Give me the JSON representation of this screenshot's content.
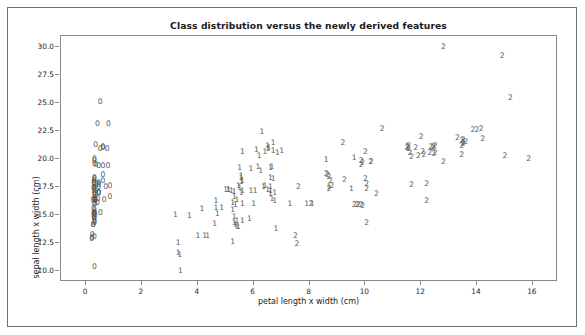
{
  "figure": {
    "title": "Class distribution versus the newly derived features",
    "background_color": "#ffffff",
    "frame_color": "#6f6f6f",
    "marker_color": "#595959"
  },
  "axes": {
    "xlabel": "petal length x width (cm)",
    "ylabel": "sepal length x width (cm)",
    "xticks": [
      "0",
      "2",
      "4",
      "6",
      "8",
      "10",
      "12",
      "14",
      "16"
    ],
    "yticks": [
      "10.0",
      "12.5",
      "15.0",
      "17.5",
      "20.0",
      "22.5",
      "25.0",
      "27.5",
      "30.0"
    ]
  },
  "chart_data": {
    "type": "scatter",
    "title": "Class distribution versus the newly derived features",
    "xlabel": "petal length x width (cm)",
    "ylabel": "sepal length x width (cm)",
    "xlim": [
      -0.9,
      16.9
    ],
    "ylim": [
      9.0,
      31.0
    ],
    "xticks": [
      0,
      2,
      4,
      6,
      8,
      10,
      12,
      14,
      16
    ],
    "yticks": [
      10.0,
      12.5,
      15.0,
      17.5,
      20.0,
      22.5,
      25.0,
      27.5,
      30.0
    ],
    "grid": false,
    "legend": "none",
    "marker_style": "class-label-text",
    "series": [
      {
        "name": "0",
        "label": "0",
        "points": [
          [
            0.28,
            17.85
          ],
          [
            0.28,
            14.7
          ],
          [
            0.26,
            15.04
          ],
          [
            0.3,
            14.56
          ],
          [
            0.28,
            18.0
          ],
          [
            0.6,
            21.06
          ],
          [
            0.24,
            16.34
          ],
          [
            0.3,
            17.0
          ],
          [
            0.2,
            12.88
          ],
          [
            0.3,
            15.19
          ],
          [
            0.45,
            19.38
          ],
          [
            0.32,
            16.32
          ],
          [
            0.24,
            14.08
          ],
          [
            0.22,
            12.9
          ],
          [
            0.4,
            23.1
          ],
          [
            0.8,
            23.1
          ],
          [
            0.6,
            21.0
          ],
          [
            0.28,
            17.85
          ],
          [
            0.75,
            20.9
          ],
          [
            0.6,
            19.38
          ],
          [
            0.45,
            17.0
          ],
          [
            0.45,
            17.64
          ],
          [
            0.3,
            16.32
          ],
          [
            0.65,
            16.32
          ],
          [
            0.51,
            15.2
          ],
          [
            0.32,
            16.5
          ],
          [
            0.45,
            17.0
          ],
          [
            0.3,
            18.2
          ],
          [
            0.3,
            17.4
          ],
          [
            0.32,
            16.2
          ],
          [
            0.32,
            15.96
          ],
          [
            0.45,
            17.0
          ],
          [
            0.3,
            20.0
          ],
          [
            0.34,
            21.28
          ],
          [
            0.3,
            15.19
          ],
          [
            0.26,
            15.5
          ],
          [
            0.42,
            16.4
          ],
          [
            0.3,
            15.19
          ],
          [
            0.22,
            13.2
          ],
          [
            0.3,
            17.4
          ],
          [
            0.26,
            17.4
          ],
          [
            0.3,
            10.35
          ],
          [
            0.26,
            14.1
          ],
          [
            0.85,
            17.6
          ],
          [
            0.78,
            19.38
          ],
          [
            0.3,
            14.7
          ],
          [
            0.6,
            18.0
          ],
          [
            0.28,
            14.8
          ],
          [
            0.5,
            25.08
          ],
          [
            0.3,
            16.5
          ],
          [
            0.3,
            16.82
          ],
          [
            0.28,
            16.0
          ],
          [
            0.45,
            17.85
          ],
          [
            0.3,
            17.1
          ],
          [
            0.3,
            15.4
          ],
          [
            0.6,
            18.6
          ],
          [
            0.3,
            19.55
          ],
          [
            0.3,
            19.8
          ],
          [
            0.4,
            16.1
          ],
          [
            0.3,
            14.3
          ],
          [
            0.3,
            13.0
          ],
          [
            0.3,
            17.2
          ],
          [
            0.5,
            20.9
          ],
          [
            0.35,
            19.5
          ],
          [
            0.3,
            17.0
          ],
          [
            0.32,
            14.95
          ],
          [
            0.38,
            17.76
          ],
          [
            0.3,
            16.3
          ],
          [
            0.7,
            17.5
          ],
          [
            0.85,
            16.6
          ],
          [
            0.3,
            17.8
          ],
          [
            0.28,
            15.0
          ],
          [
            0.3,
            14.4
          ],
          [
            0.3,
            18.3
          ],
          [
            0.45,
            17.5
          ]
        ]
      },
      {
        "name": "1",
        "label": "1",
        "points": [
          [
            3.3,
            12.5
          ],
          [
            3.3,
            11.6
          ],
          [
            3.35,
            11.4
          ],
          [
            3.38,
            10.0
          ],
          [
            3.2,
            15.0
          ],
          [
            3.7,
            14.9
          ],
          [
            4.0,
            13.1
          ],
          [
            4.25,
            13.1
          ],
          [
            4.35,
            13.1
          ],
          [
            4.15,
            15.5
          ],
          [
            4.6,
            14.2
          ],
          [
            4.65,
            16.2
          ],
          [
            4.65,
            15.6
          ],
          [
            4.7,
            15.1
          ],
          [
            5.1,
            17.2
          ],
          [
            5.2,
            17.1
          ],
          [
            5.3,
            17.05
          ],
          [
            5.25,
            16.05
          ],
          [
            5.3,
            14.3
          ],
          [
            5.35,
            14.1
          ],
          [
            5.4,
            14.5
          ],
          [
            5.25,
            12.6
          ],
          [
            5.55,
            18.3
          ],
          [
            5.55,
            17.9
          ],
          [
            5.5,
            19.2
          ],
          [
            5.6,
            20.6
          ],
          [
            5.55,
            16.95
          ],
          [
            5.6,
            17.1
          ],
          [
            5.6,
            16.0
          ],
          [
            5.85,
            14.6
          ],
          [
            5.9,
            19.1
          ],
          [
            6.0,
            16.0
          ],
          [
            6.1,
            20.8
          ],
          [
            6.15,
            19.3
          ],
          [
            6.3,
            22.4
          ],
          [
            6.35,
            17.5
          ],
          [
            6.4,
            20.6
          ],
          [
            6.5,
            21.2
          ],
          [
            6.55,
            20.95
          ],
          [
            6.6,
            18.3
          ],
          [
            6.6,
            17.5
          ],
          [
            6.6,
            17.15
          ],
          [
            6.65,
            19.3
          ],
          [
            6.7,
            21.4
          ],
          [
            6.7,
            20.7
          ],
          [
            6.7,
            18.2
          ],
          [
            6.75,
            17.0
          ],
          [
            6.75,
            16.2
          ],
          [
            6.8,
            13.7
          ],
          [
            7.3,
            16.0
          ],
          [
            7.9,
            16.0
          ],
          [
            8.6,
            19.9
          ],
          [
            5.1,
            17.2
          ],
          [
            5.0,
            17.2
          ],
          [
            5.45,
            17.6
          ],
          [
            5.5,
            17.4
          ],
          [
            6.2,
            20.3
          ],
          [
            4.85,
            15.6
          ],
          [
            5.35,
            15.9
          ],
          [
            5.3,
            14.85
          ],
          [
            5.6,
            14.5
          ],
          [
            6.05,
            17.1
          ],
          [
            6.5,
            17.2
          ],
          [
            6.4,
            17.6
          ],
          [
            6.6,
            16.85
          ],
          [
            6.65,
            16.4
          ],
          [
            6.5,
            20.9
          ],
          [
            7.0,
            20.75
          ],
          [
            5.9,
            17.1
          ],
          [
            6.25,
            18.9
          ],
          [
            6.6,
            19.2
          ],
          [
            8.1,
            15.95
          ],
          [
            8.7,
            17.5
          ],
          [
            6.85,
            20.55
          ],
          [
            5.6,
            18.05
          ],
          [
            5.55,
            18.5
          ],
          [
            5.3,
            16.6
          ],
          [
            5.4,
            16.35
          ],
          [
            5.25,
            15.4
          ],
          [
            5.4,
            13.95
          ],
          [
            5.45,
            13.9
          ],
          [
            9.5,
            17.3
          ],
          [
            9.6,
            20.1
          ]
        ]
      },
      {
        "name": "2",
        "label": "2",
        "points": [
          [
            12.8,
            30.0
          ],
          [
            14.9,
            29.2
          ],
          [
            15.2,
            25.5
          ],
          [
            10.6,
            22.7
          ],
          [
            14.0,
            22.6
          ],
          [
            14.15,
            22.7
          ],
          [
            12.0,
            22.0
          ],
          [
            13.3,
            21.9
          ],
          [
            14.2,
            21.8
          ],
          [
            13.5,
            21.7
          ],
          [
            13.6,
            21.5
          ],
          [
            11.55,
            21.2
          ],
          [
            11.5,
            21.0
          ],
          [
            12.45,
            21.1
          ],
          [
            12.4,
            21.0
          ],
          [
            11.8,
            21.0
          ],
          [
            13.5,
            21.35
          ],
          [
            13.45,
            21.2
          ],
          [
            9.2,
            21.4
          ],
          [
            10.0,
            20.6
          ],
          [
            11.6,
            20.55
          ],
          [
            12.1,
            20.4
          ],
          [
            12.5,
            20.5
          ],
          [
            11.65,
            20.2
          ],
          [
            13.45,
            20.35
          ],
          [
            15.0,
            20.3
          ],
          [
            15.85,
            20.0
          ],
          [
            12.8,
            19.7
          ],
          [
            9.85,
            19.8
          ],
          [
            9.85,
            19.45
          ],
          [
            10.2,
            19.75
          ],
          [
            8.6,
            18.7
          ],
          [
            8.7,
            18.35
          ],
          [
            8.75,
            18.05
          ],
          [
            9.25,
            18.1
          ],
          [
            10.0,
            18.25
          ],
          [
            10.05,
            17.8
          ],
          [
            11.65,
            17.7
          ],
          [
            12.2,
            17.75
          ],
          [
            8.7,
            17.3
          ],
          [
            10.05,
            17.3
          ],
          [
            10.4,
            16.9
          ],
          [
            12.2,
            16.2
          ],
          [
            9.7,
            15.85
          ],
          [
            9.85,
            15.85
          ],
          [
            9.9,
            15.8
          ],
          [
            10.05,
            14.3
          ],
          [
            7.5,
            13.1
          ],
          [
            7.55,
            12.4
          ],
          [
            7.6,
            17.5
          ],
          [
            8.05,
            16.0
          ],
          [
            12.3,
            20.55
          ],
          [
            12.35,
            21.1
          ],
          [
            11.5,
            21.1
          ],
          [
            11.55,
            20.9
          ],
          [
            13.45,
            21.6
          ],
          [
            13.5,
            21.45
          ],
          [
            12.5,
            21.15
          ],
          [
            12.45,
            20.45
          ],
          [
            9.75,
            15.85
          ],
          [
            11.9,
            20.3
          ],
          [
            12.05,
            20.6
          ],
          [
            13.85,
            22.6
          ],
          [
            9.6,
            15.9
          ],
          [
            10.2,
            19.7
          ],
          [
            9.9,
            19.6
          ],
          [
            8.65,
            18.55
          ],
          [
            8.8,
            17.55
          ]
        ]
      }
    ]
  }
}
